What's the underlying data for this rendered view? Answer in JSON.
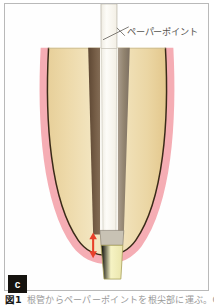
{
  "figure": {
    "panel_letter": "c",
    "caption_number": "図1",
    "caption_text": "根管からペーパーポイントを根尖部に運ぶ。Oリン",
    "domain_subject": "dental-root-canal-cross-section"
  },
  "annotations": {
    "paper_point_label": "ペーパーポイント"
  },
  "colors": {
    "frame_border": "#b9b9b9",
    "background": "#ffffff",
    "dentin_light": "#f2e4bd",
    "dentin_mid": "#e9d5a3",
    "dentin_edge": "#e0c88c",
    "tooth_outline": "#3a2a18",
    "periodontal_pink": "#f4a9b0",
    "canal_wall_left": "#6b5440",
    "canal_wall_right": "#9b8e80",
    "paper_point_white": "#fbfaf6",
    "apical_pale_yellow": "#f4f1ba",
    "arrow_red": "#e8402a",
    "badge_background": "#15130f",
    "badge_text": "#ffffff",
    "label_text": "#55534f"
  },
  "diagram": {
    "parts": [
      {
        "name": "periodontal-ligament",
        "label": "歯根膜",
        "color": "#f4a9b0"
      },
      {
        "name": "dentin-body",
        "label": "象牙質",
        "color": "#e9d5a3"
      },
      {
        "name": "root-canal-wall-left",
        "label": "根管壁",
        "color": "#6b5440"
      },
      {
        "name": "root-canal-wall-right",
        "label": "根管壁",
        "color": "#9b8e80"
      },
      {
        "name": "paper-point",
        "label": "ペーパーポイント",
        "color": "#fbfaf6"
      },
      {
        "name": "apical-region",
        "label": "根尖部",
        "color": "#f4f1ba"
      },
      {
        "name": "depth-arrow",
        "label": "挿入深度",
        "color": "#e8402a"
      }
    ]
  }
}
